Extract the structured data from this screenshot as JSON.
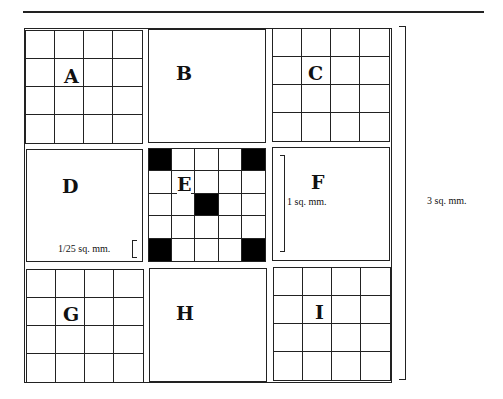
{
  "figure": {
    "panels": [
      {
        "id": "A",
        "label": "A",
        "type": "grid",
        "divisions": 4
      },
      {
        "id": "B",
        "label": "B",
        "type": "empty"
      },
      {
        "id": "C",
        "label": "C",
        "type": "grid",
        "divisions": 4
      },
      {
        "id": "D",
        "label": "D",
        "type": "empty",
        "annotation": "1/25 sq. mm."
      },
      {
        "id": "E",
        "label": "E",
        "type": "grid",
        "divisions": 5,
        "black_cells": [
          [
            0,
            0
          ],
          [
            0,
            4
          ],
          [
            2,
            2
          ],
          [
            4,
            0
          ],
          [
            4,
            4
          ]
        ]
      },
      {
        "id": "F",
        "label": "F",
        "type": "empty",
        "annotation": "1 sq. mm."
      },
      {
        "id": "G",
        "label": "G",
        "type": "grid",
        "divisions": 4
      },
      {
        "id": "H",
        "label": "H",
        "type": "empty"
      },
      {
        "id": "I",
        "label": "I",
        "type": "grid",
        "divisions": 4
      }
    ],
    "total_annotation": "3 sq. mm."
  }
}
